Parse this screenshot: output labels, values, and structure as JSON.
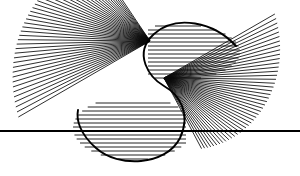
{
  "figure": {
    "canvas": {
      "width": 300,
      "height": 176,
      "background": "#ffffff"
    },
    "ink_color": "#0a0a0a",
    "outline_color": "#000000"
  },
  "chart_data": {
    "type": "line",
    "xlabel": "",
    "ylabel": "",
    "xlim": [
      0,
      300
    ],
    "ylim": [
      0,
      176
    ],
    "grid": false,
    "legend": "none",
    "elements": [
      {
        "name": "upper-left-fan",
        "kind": "radial-fan",
        "focus": [
          150,
          41
        ],
        "line_count": 46,
        "angle_start_deg": 150,
        "angle_end_deg": 236,
        "radius_min": 96,
        "radius_max": 152,
        "note": "Chords sweep from upper-left rim down to lower-left; lengths shorten as the fan rotates toward the centre, generating the upper lobe envelope."
      },
      {
        "name": "lower-right-fan",
        "kind": "radial-fan",
        "focus": [
          164,
          78
        ],
        "line_count": 46,
        "angle_start_deg": -30,
        "angle_end_deg": 62,
        "radius_min": 80,
        "radius_max": 128,
        "note": "Mirror image of the upper-left fan, rotated 180 degrees about the figure centre."
      },
      {
        "name": "upper-lobe-hatch",
        "kind": "horizontal-hatch",
        "y_from": 24,
        "y_to": 78,
        "spacing": 4.0,
        "note": "Horizontal chords filling the upper bulb of the S between its arc cap and the waist."
      },
      {
        "name": "lower-lobe-hatch",
        "kind": "horizontal-hatch",
        "y_from": 104,
        "y_to": 160,
        "spacing": 4.0,
        "note": "Horizontal chords filling the lower bulb of the S."
      },
      {
        "name": "s-curve-outline",
        "kind": "stroke-path",
        "note": "Heavy black arc following the outer boundary of the S: over the top of the upper bulb, in through the waist, and around the bottom of the lower bulb."
      },
      {
        "name": "baseline",
        "kind": "axis-line",
        "y": 131,
        "x_from": 0,
        "x_to": 300,
        "stroke_width": 2,
        "note": "Single full-width horizontal rule crossing the whole composition."
      }
    ]
  },
  "geometry": {
    "fans": [
      {
        "id": "fan-upper-left",
        "cx": 150.0,
        "cy": 41.0,
        "count": 46,
        "a0": 150.0,
        "a1": 236.0,
        "r0": 152.0,
        "r1": 96.0,
        "inner0": 0.0,
        "inner1": 0.0,
        "skew": 1.0
      },
      {
        "id": "fan-lower-right",
        "cx": 164.0,
        "cy": 78.0,
        "count": 46,
        "a0": -30.0,
        "a1": 62.0,
        "r0": 128.0,
        "r1": 80.0,
        "inner0": 0.0,
        "inner1": 0.0,
        "skew": 1.0
      }
    ],
    "hatches": [
      {
        "id": "hatch-upper",
        "y0": 26.0,
        "y1": 79.0,
        "step": 4.0,
        "cx": 178.0,
        "cy": 52.0,
        "rx": 62.0,
        "ry": 28.0,
        "clip_left": 148.0
      },
      {
        "id": "hatch-lower",
        "y0": 103.0,
        "y1": 159.0,
        "step": 4.0,
        "cx": 133.0,
        "cy": 128.0,
        "rx": 60.0,
        "ry": 32.0,
        "clip_right": 186.0
      }
    ],
    "outline": "M 236 46 C 214 22 176 14 154 34 C 132 54 150 78 164 86 C 178 94 192 112 180 138 C 166 166 118 168 96 148 C 80 134 76 120 78 110",
    "baseline": {
      "y": 131.0,
      "x0": 0.0,
      "x1": 300.0
    }
  }
}
